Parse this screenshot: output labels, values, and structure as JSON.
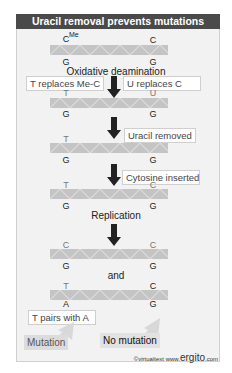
{
  "title": "Uracil removal prevents mutations",
  "steps": [
    {
      "top_left": "C",
      "top_left_sup": "Me",
      "top_right": "C",
      "bottom_left": "G",
      "bottom_right": "G"
    },
    {
      "top_left": "T",
      "top_right": "U",
      "bottom_left": "G",
      "bottom_right": "G"
    },
    {
      "top_left": "T",
      "top_right": "",
      "bottom_left": "G",
      "bottom_right": "G"
    },
    {
      "top_left": "T",
      "top_right": "C",
      "bottom_left": "G",
      "bottom_right": "G"
    },
    {
      "top_left": "C",
      "top_right": "C",
      "bottom_left": "G",
      "bottom_right": "G"
    },
    {
      "top_left": "T",
      "top_right": "C",
      "bottom_left": "A",
      "bottom_right": "G"
    }
  ],
  "captions": {
    "oxidative": "Oxidative deamination",
    "replication": "Replication",
    "and": "and"
  },
  "labels": {
    "t_replaces": "T replaces Me-C",
    "u_replaces": "U replaces C",
    "uracil_removed": "Uracil removed",
    "cytosine_inserted": "Cytosine inserted",
    "t_pairs": "T pairs with A"
  },
  "results": {
    "mutation": "Mutation",
    "no_mutation": "No mutation"
  },
  "credit": {
    "prefix": "©virtualtext",
    "www": "www.",
    "brand": "ergito",
    "suffix": ".com"
  },
  "colors": {
    "title_bg": "#4a4a4a",
    "panel_bg": "#f2f2f2",
    "strand": "#c4c4c4",
    "arrow": "#222222",
    "result_arrow": "#d6d6d6"
  }
}
